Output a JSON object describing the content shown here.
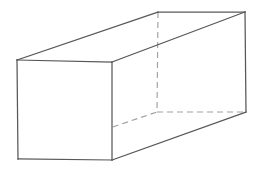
{
  "figure": {
    "shape_name": "rectangular-prism",
    "projection": "oblique parallel projection",
    "canvas": {
      "width": 261,
      "height": 170,
      "background": "#ffffff"
    },
    "colors": {
      "visible_edge": "#585858",
      "hidden_edge": "#a0a0a0",
      "face_fill": "#ffffff",
      "background": "#ffffff"
    },
    "stroke": {
      "visible_width": 1.25,
      "hidden_width": 1.15,
      "hidden_dash_pattern": "6 4"
    },
    "vertices": {
      "front_top_left": [
        17,
        60
      ],
      "front_top_right": [
        112,
        62
      ],
      "front_bottom_right": [
        112,
        160
      ],
      "front_bottom_left": [
        18,
        159
      ],
      "back_top_left": [
        158,
        12
      ],
      "back_top_right": [
        245,
        12
      ],
      "back_bottom_right": [
        246,
        112
      ],
      "back_bottom_left_hidden": [
        157,
        112
      ]
    },
    "faces": {
      "front": "17,60 112,62 112,160 18,159",
      "top": "17,60 158,12 245,12 112,62",
      "right": "112,62 245,12 246,112 112,160"
    },
    "edges_visible": [
      {
        "name": "front-top",
        "points": "17,60 112,62"
      },
      {
        "name": "front-right",
        "points": "112,62 112,160"
      },
      {
        "name": "front-bottom",
        "points": "112,160 18,159"
      },
      {
        "name": "front-left",
        "points": "18,159 17,60"
      },
      {
        "name": "top-left-receding",
        "points": "17,60 158,12"
      },
      {
        "name": "top-back",
        "points": "158,12 245,12"
      },
      {
        "name": "top-right-receding",
        "points": "112,62 245,12"
      },
      {
        "name": "back-right-vertical",
        "points": "245,12 246,112"
      },
      {
        "name": "bottom-right-receding",
        "points": "112,160 246,112"
      }
    ],
    "edges_hidden": [
      {
        "name": "hidden-vertical-back-left",
        "points": "158,12 157,112"
      },
      {
        "name": "hidden-bottom-receding",
        "points": "18,159 157,112"
      },
      {
        "name": "hidden-bottom-back",
        "points": "157,112 246,112"
      }
    ]
  }
}
